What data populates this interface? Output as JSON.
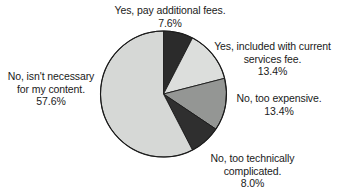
{
  "chart_data": {
    "type": "pie",
    "title": "",
    "xlabel": "",
    "ylabel": "",
    "legend_position": "none",
    "grid": false,
    "unit": "%",
    "start_angle_deg": 0,
    "direction": "clockwise",
    "categories": [
      "Yes, pay additional fees.",
      "Yes, included with current services fee.",
      "No, too expensive.",
      "No, too technically complicated.",
      "No, isn't necessary for my content."
    ],
    "values": [
      7.6,
      13.4,
      13.4,
      8.0,
      57.6
    ],
    "colors": [
      "#2b2b2b",
      "#dcdedc",
      "#949694",
      "#2f2f2f",
      "#d6d8d6"
    ],
    "slices": [
      {
        "name": "Yes, pay additional fees.",
        "value": 7.6,
        "value_label": "7.6%",
        "color": "#2b2b2b",
        "start_deg": 0,
        "end_deg": 27.36
      },
      {
        "name": "Yes, included with current services fee.",
        "value": 13.4,
        "value_label": "13.4%",
        "color": "#dcdedc",
        "start_deg": 27.36,
        "end_deg": 75.6
      },
      {
        "name": "No, too expensive.",
        "value": 13.4,
        "value_label": "13.4%",
        "color": "#949694",
        "start_deg": 75.6,
        "end_deg": 123.84
      },
      {
        "name": "No, too technically complicated.",
        "value": 8.0,
        "value_label": "8.0%",
        "color": "#2f2f2f",
        "start_deg": 123.84,
        "end_deg": 152.64
      },
      {
        "name": "No, isn't necessary for my content.",
        "value": 57.6,
        "value_label": "57.6%",
        "color": "#d6d8d6",
        "start_deg": 152.64,
        "end_deg": 360
      }
    ]
  },
  "labels": {
    "top": {
      "line1": "Yes, pay additional fees.",
      "line2": "7.6%"
    },
    "included": {
      "line1": "Yes, included with current",
      "line2": "services fee.",
      "line3": "13.4%"
    },
    "expensive": {
      "line1": "No, too expensive.",
      "line2": "13.4%"
    },
    "technical": {
      "line1": "No, too technically",
      "line2": "complicated.",
      "line3": "8.0%"
    },
    "not_necessary": {
      "line1": "No, isn't necessary",
      "line2": "for my content.",
      "line3": "57.6%"
    }
  }
}
